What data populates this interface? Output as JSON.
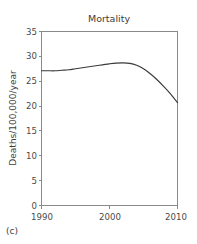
{
  "figure": {
    "panel_label": "(c)",
    "background_color": "#ffffff"
  },
  "chart_data": {
    "type": "line",
    "title": "Mortality",
    "xlabel": "",
    "ylabel": "Deaths/100,000/year",
    "xlim": [
      1990,
      2010
    ],
    "ylim": [
      0,
      35
    ],
    "xticks": [
      1990,
      2000,
      2010
    ],
    "xtick_labels": [
      "1990",
      "2000",
      "2010"
    ],
    "yticks": [
      0,
      5,
      10,
      15,
      20,
      25,
      30,
      35
    ],
    "ytick_labels": [
      "0",
      "5",
      "10",
      "15",
      "20",
      "25",
      "30",
      "35"
    ],
    "grid": false,
    "legend": false,
    "legend_position": "none",
    "line_color": "#3a3a3a",
    "axis_color": "#8a8a8a",
    "series": [
      {
        "name": "Mortality rate",
        "x": [
          1990,
          1991,
          1992,
          1993,
          1994,
          1995,
          1996,
          1997,
          1998,
          1999,
          2000,
          2001,
          2002,
          2003,
          2004,
          2005,
          2006,
          2007,
          2008,
          2009,
          2010
        ],
        "values": [
          27.1,
          27.1,
          27.1,
          27.2,
          27.3,
          27.5,
          27.7,
          27.9,
          28.1,
          28.3,
          28.5,
          28.65,
          28.7,
          28.6,
          28.2,
          27.5,
          26.5,
          25.3,
          23.9,
          22.4,
          20.7
        ]
      }
    ]
  }
}
